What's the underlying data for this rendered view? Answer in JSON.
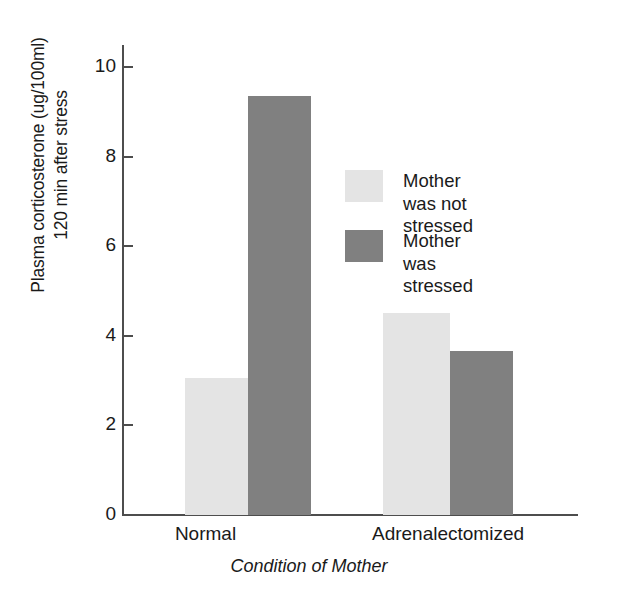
{
  "chart_data": {
    "type": "bar",
    "title": "",
    "xlabel": "Condition of Mother",
    "ylabel": "Plasma corticosterone (ug/100ml) 120 min after stress",
    "ylabel_lines": [
      "Plasma corticosterone (ug/100ml)",
      "120 min after stress"
    ],
    "categories": [
      "Normal",
      "Adrenalectomized"
    ],
    "series": [
      {
        "name": "Mother was not stressed",
        "color": "#e4e4e4",
        "values": [
          3.05,
          4.5
        ]
      },
      {
        "name": "Mother was stressed",
        "color": "#808080",
        "values": [
          9.35,
          3.65
        ]
      }
    ],
    "ylim": [
      0,
      10
    ],
    "yticks": [
      0,
      2,
      4,
      6,
      8,
      10
    ],
    "ytick_labels": [
      "0",
      "2",
      "4",
      "6",
      "8",
      "10"
    ],
    "grid": false,
    "legend_position": "inside-upper-right",
    "legend_entries": [
      {
        "label": "Mother was not\nstressed",
        "color": "#e4e4e4"
      },
      {
        "label": "Mother was stressed",
        "color": "#808080"
      }
    ]
  },
  "axis": {
    "line_color": "#4d4d4d"
  }
}
